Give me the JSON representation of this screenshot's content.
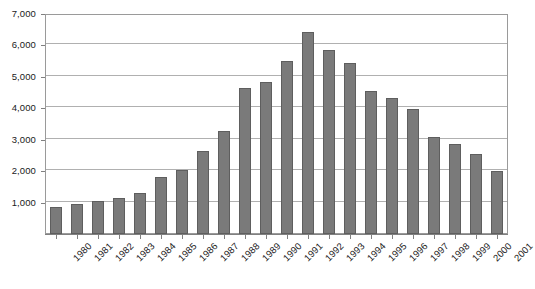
{
  "chart_data": {
    "type": "bar",
    "title": "",
    "subtitle": "",
    "xlabel": "",
    "ylabel": "",
    "categories": [
      "1980",
      "1981",
      "1982",
      "1983",
      "1984",
      "1985",
      "1986",
      "1987",
      "1988",
      "1989",
      "1990",
      "1991",
      "1992",
      "1993",
      "1994",
      "1995",
      "1996",
      "1997",
      "1998",
      "1999",
      "2000",
      "2001"
    ],
    "values": [
      850,
      960,
      1060,
      1150,
      1300,
      1820,
      2050,
      2650,
      3280,
      4650,
      4830,
      5500,
      6430,
      5850,
      5450,
      4560,
      4320,
      3980,
      3100,
      2880,
      2550,
      2010
    ],
    "ylim": [
      0,
      7000
    ],
    "ytick_labels": [
      "7,000",
      "6,000",
      "5,000",
      "4,000",
      "3,000",
      "2,000",
      "1,000"
    ],
    "ytick_values": [
      7000,
      6000,
      5000,
      4000,
      3000,
      2000,
      1000
    ],
    "grid": true,
    "legend": "none",
    "series": [
      {
        "name": "",
        "values": [
          850,
          960,
          1060,
          1150,
          1300,
          1820,
          2050,
          2650,
          3280,
          4650,
          4830,
          5500,
          6430,
          5850,
          5450,
          4560,
          4320,
          3980,
          3100,
          2880,
          2550,
          2010
        ]
      }
    ]
  },
  "colors": {
    "bar_fill": "#7a7a7a",
    "bar_border": "#5e5e5e",
    "gridline": "#b0b0b0",
    "axis": "#808080",
    "frame": "#9a9a9a",
    "text": "#1a1a1a",
    "background": "#ffffff"
  }
}
